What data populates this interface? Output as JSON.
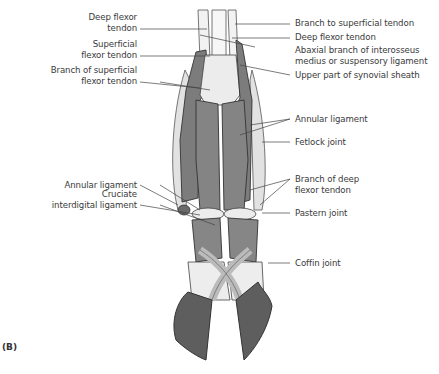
{
  "figure": {
    "panel_label": "(B)",
    "colors": {
      "bone_light": "#ececec",
      "tendon_dark": "#7c7c7c",
      "hoof": "#5e5e5e",
      "outline": "#3a3a3a",
      "leader": "#444444",
      "text": "#3a3a3a"
    }
  },
  "labels_left": [
    {
      "id": "deep-flexor-tendon-left",
      "lines": [
        "Deep flexor",
        "tendon"
      ]
    },
    {
      "id": "superficial-flexor-tendon",
      "lines": [
        "Superficial",
        "flexor tendon"
      ]
    },
    {
      "id": "branch-of-superficial-flexor-tendon",
      "lines": [
        "Branch of superficial",
        "flexor tendon"
      ]
    },
    {
      "id": "annular-ligament-left",
      "lines": [
        "Annular ligament"
      ]
    },
    {
      "id": "cruciate-interdigital-ligament",
      "lines": [
        "Cruciate",
        "interdigital ligament"
      ]
    }
  ],
  "labels_right": [
    {
      "id": "branch-to-superficial-tendon",
      "lines": [
        "Branch to superficial tendon"
      ]
    },
    {
      "id": "deep-flexor-tendon-right",
      "lines": [
        "Deep flexor tendon"
      ]
    },
    {
      "id": "abaxial-branch",
      "lines": [
        "Abaxial branch of interosseus",
        "medius or suspensory ligament"
      ]
    },
    {
      "id": "upper-part-of-synovial-sheath",
      "lines": [
        "Upper part of synovial sheath"
      ]
    },
    {
      "id": "annular-ligament-right",
      "lines": [
        "Annular ligament"
      ]
    },
    {
      "id": "fetlock-joint",
      "lines": [
        "Fetlock joint"
      ]
    },
    {
      "id": "branch-of-deep-flexor-tendon",
      "lines": [
        "Branch of deep",
        "flexor tendon"
      ]
    },
    {
      "id": "pastern-joint",
      "lines": [
        "Pastern joint"
      ]
    },
    {
      "id": "coffin-joint",
      "lines": [
        "Coffin joint"
      ]
    }
  ]
}
